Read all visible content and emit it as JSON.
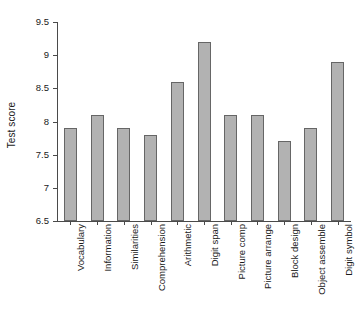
{
  "chart_data": {
    "type": "bar",
    "title": "",
    "xlabel": "",
    "ylabel": "Test score",
    "categories": [
      "Vocabulary",
      "Information",
      "Similarities",
      "Comprehension",
      "Arithmetic",
      "Digit span",
      "Picture comp",
      "Picture arrange",
      "Block design",
      "Object assemble",
      "Digit symbol"
    ],
    "values": [
      7.9,
      8.1,
      7.9,
      7.8,
      8.6,
      9.2,
      8.1,
      8.1,
      7.7,
      7.9,
      8.9
    ],
    "ylim": [
      6.5,
      9.5
    ],
    "ytick_labels": [
      "6.5",
      "7",
      "7.5",
      "8",
      "8.5",
      "9",
      "9.5"
    ],
    "ytick_values": [
      6.5,
      7,
      7.5,
      8,
      8.5,
      9,
      9.5
    ],
    "grid": false,
    "legend": null,
    "bar_color": "#b2b2b2",
    "bar_edge_color": "#666666",
    "axis_color": "#4a4a4a",
    "background": "#ffffff"
  }
}
